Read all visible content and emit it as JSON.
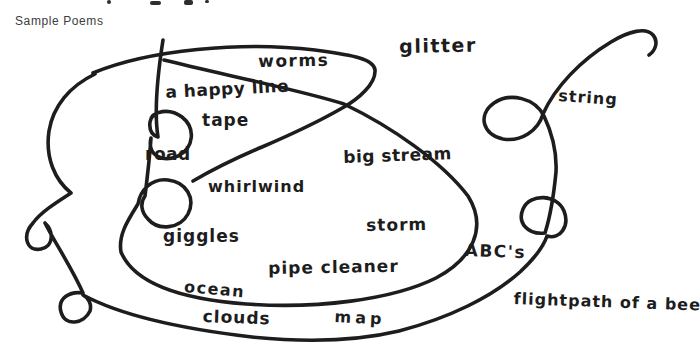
{
  "document": {
    "heading": "Sample Poems"
  },
  "doodle": {
    "words": [
      "worms",
      "glitter",
      "a happy line",
      "tape",
      "road",
      "big stream",
      "string",
      "whirlwind",
      "storm",
      "giggles",
      "ABC's",
      "pipe cleaner",
      "ocean",
      "flightpath of a bee",
      "clouds",
      "map"
    ]
  },
  "colors": {
    "ink": "#1d1d1d",
    "heading_text": "#3c3c3c",
    "background": "#ffffff"
  }
}
